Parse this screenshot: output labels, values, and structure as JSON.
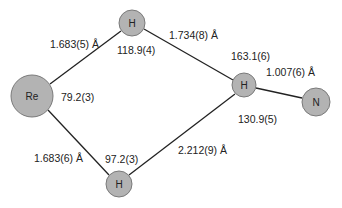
{
  "colors": {
    "atom_fill": "#b3b3b3",
    "atom_stroke": "#7a7a7a",
    "bond": "#222222",
    "text": "#222222"
  },
  "atoms": [
    {
      "id": "re",
      "label": "Re",
      "cx": 32,
      "cy": 96,
      "r": 21
    },
    {
      "id": "h_top",
      "label": "H",
      "cx": 132,
      "cy": 23,
      "r": 13
    },
    {
      "id": "h_right",
      "label": "H",
      "cx": 244,
      "cy": 85,
      "r": 12
    },
    {
      "id": "n",
      "label": "N",
      "cx": 316,
      "cy": 102,
      "r": 14
    },
    {
      "id": "h_bottom",
      "label": "H",
      "cx": 119,
      "cy": 184,
      "r": 13
    }
  ],
  "bonds": [
    {
      "from": "re",
      "to": "h_top",
      "length_label": "1.683(5) Å"
    },
    {
      "from": "re",
      "to": "h_bottom",
      "length_label": "1.683(6) Å"
    },
    {
      "from": "h_top",
      "to": "h_right",
      "length_label": "1.734(8) Å"
    },
    {
      "from": "h_bottom",
      "to": "h_right",
      "length_label": "2.212(9) Å"
    },
    {
      "from": "h_right",
      "to": "n",
      "length_label": "1.007(6) Å"
    }
  ],
  "labels": {
    "bond_re_htop": "1.683(5) Å",
    "bond_re_hbottom": "1.683(6) Å",
    "bond_htop_hright": "1.734(8) Å",
    "bond_hbottom_hright": "2.212(9) Å",
    "bond_hright_n": "1.007(6) Å",
    "angle_htop": "118.9(4)",
    "angle_re": "79.2(3)",
    "angle_hbottom": "97.2(3)",
    "angle_hright_upper": "163.1(6)",
    "angle_hright_lower": "130.9(5)"
  },
  "atom_labels": {
    "re": "Re",
    "h_top": "H",
    "h_right": "H",
    "n": "N",
    "h_bottom": "H"
  }
}
